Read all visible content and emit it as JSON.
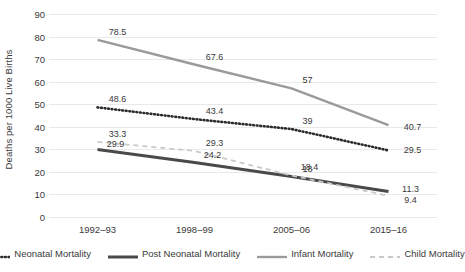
{
  "chart_data": {
    "type": "line",
    "title": "",
    "xlabel": "",
    "ylabel": "Deaths per 1000 Live Births",
    "categories": [
      "1992–93",
      "1998–99",
      "2005–06",
      "2015–16"
    ],
    "ylim": [
      0,
      90
    ],
    "yticks": [
      0,
      10,
      20,
      30,
      40,
      50,
      60,
      70,
      80,
      90
    ],
    "ytick_labels": [
      "0",
      "10",
      "20",
      "30",
      "40",
      "50",
      "60",
      "70",
      "80",
      "90"
    ],
    "grid": true,
    "legend_position": "bottom",
    "series": [
      {
        "name": "Neonatal Mortality",
        "style": "dotted",
        "color": "#2b2b2b",
        "width": 2.6,
        "values": [
          48.6,
          43.4,
          39,
          29.5
        ],
        "labels": [
          "48.6",
          "43.4",
          "39",
          "29.5"
        ]
      },
      {
        "name": "Post Neonatal Mortality",
        "style": "solid",
        "color": "#4a4a4a",
        "width": 3.0,
        "values": [
          29.9,
          24.2,
          18,
          11.3
        ],
        "labels": [
          "29.9",
          "24.2",
          "18",
          "11.3"
        ]
      },
      {
        "name": "Infant Mortality",
        "style": "solid",
        "color": "#9a9a9a",
        "width": 2.4,
        "values": [
          78.5,
          67.6,
          57,
          40.7
        ],
        "labels": [
          "78.5",
          "67.6",
          "57",
          "40.7"
        ]
      },
      {
        "name": "Child Mortality",
        "style": "dashed",
        "color": "#c9c9c9",
        "width": 1.8,
        "values": [
          33.3,
          29.3,
          18.4,
          9.4
        ],
        "labels": [
          "33.3",
          "29.3",
          "18.4",
          "9.4"
        ]
      }
    ]
  },
  "colors": {
    "background": "#ffffff",
    "gridline": "#e9e9e9",
    "text": "#3a3a3a"
  }
}
